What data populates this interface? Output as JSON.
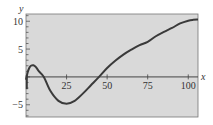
{
  "chart_data": {
    "type": "line",
    "title": "",
    "xlabel": "x",
    "ylabel": "y",
    "xlim": [
      0,
      106
    ],
    "ylim": [
      -7.2,
      11.3
    ],
    "grid": false,
    "legend": null,
    "x_ticks": [
      25,
      50,
      75,
      100
    ],
    "x_tick_labels": [
      "25",
      "50",
      "75",
      "100"
    ],
    "y_ticks": [
      -5,
      5,
      10
    ],
    "y_tick_labels": [
      "-5",
      "5",
      "10"
    ],
    "series": [
      {
        "name": "y(x)",
        "x": [
          0,
          1,
          2,
          3,
          4.6,
          6,
          8,
          11,
          15,
          20,
          25,
          30,
          35,
          40,
          45,
          50,
          55,
          60,
          65,
          70,
          75,
          80,
          85,
          90,
          95,
          100,
          103,
          106
        ],
        "values": [
          -0.5,
          0.8,
          1.6,
          2.0,
          2.1,
          1.8,
          1.0,
          0.0,
          -2.5,
          -4.3,
          -4.8,
          -4.3,
          -3.0,
          -1.5,
          0.0,
          1.6,
          2.9,
          4.0,
          4.9,
          5.7,
          6.3,
          7.3,
          8.1,
          8.8,
          9.6,
          10.1,
          10.25,
          10.3
        ],
        "color": "#3a3a3a"
      }
    ]
  },
  "style": {
    "plot_bg": "#d9d9d9",
    "frame_color": "#555555",
    "line_color": "#3a3a3a"
  }
}
